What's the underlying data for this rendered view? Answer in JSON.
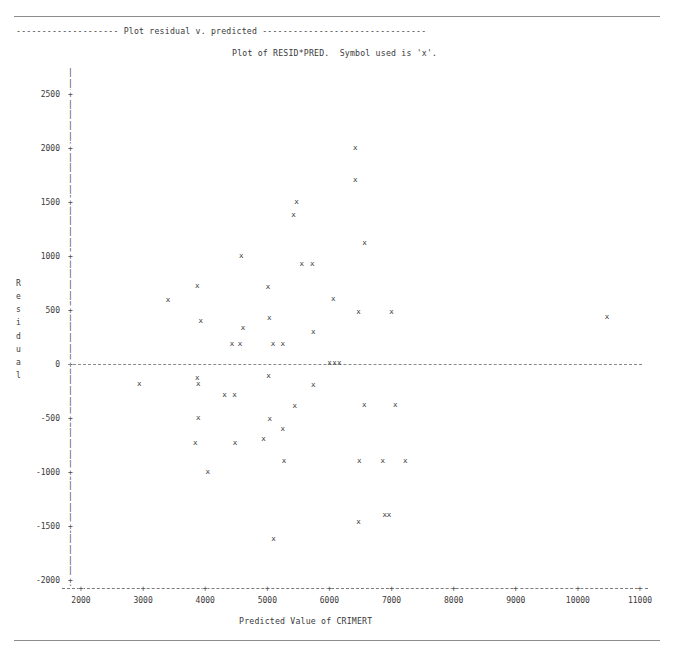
{
  "page": {
    "section_banner": "-------------------- Plot residual v. predicted --------------------------------",
    "plot_title": "Plot of RESID*PRED.  Symbol used is 'x'.",
    "rule_color": "#8d8d8d",
    "ink_color": "#2d2d2d"
  },
  "chart_data": {
    "type": "scatter",
    "title": "Plot of RESID*PRED.  Symbol used is 'x'.",
    "xlabel": "Predicted Value of CRIMERT",
    "ylabel": "Residual",
    "ylabel_letters": [
      "R",
      "e",
      "s",
      "i",
      "d",
      "u",
      "a",
      "l"
    ],
    "symbol": "x",
    "grid": false,
    "legend": "none",
    "xlim": [
      2000,
      11000
    ],
    "ylim": [
      -2000,
      2700
    ],
    "xticks": [
      2000,
      3000,
      4000,
      5000,
      6000,
      7000,
      8000,
      9000,
      10000,
      11000
    ],
    "yticks": [
      2500,
      2000,
      1500,
      1000,
      500,
      0,
      -500,
      -1000,
      -1500,
      -2000
    ],
    "ytick_labels": [
      "2500",
      "2000",
      "1500",
      "1000",
      "500",
      "0",
      "-500",
      "-1000",
      "-1500",
      "-2000"
    ],
    "xtick_labels": [
      "2000",
      "3000",
      "4000",
      "5000",
      "6000",
      "7000",
      "8000",
      "9000",
      "10000",
      "11000"
    ],
    "zero_line": 0,
    "points": [
      {
        "x": 6415,
        "y": 2000
      },
      {
        "x": 6415,
        "y": 1700
      },
      {
        "x": 5470,
        "y": 1500
      },
      {
        "x": 5420,
        "y": 1380
      },
      {
        "x": 6565,
        "y": 1120
      },
      {
        "x": 4580,
        "y": 1000
      },
      {
        "x": 5555,
        "y": 920
      },
      {
        "x": 5725,
        "y": 920
      },
      {
        "x": 3870,
        "y": 720
      },
      {
        "x": 5010,
        "y": 710
      },
      {
        "x": 6060,
        "y": 600
      },
      {
        "x": 3400,
        "y": 590
      },
      {
        "x": 6470,
        "y": 480
      },
      {
        "x": 7000,
        "y": 480
      },
      {
        "x": 10470,
        "y": 430
      },
      {
        "x": 3930,
        "y": 400
      },
      {
        "x": 5030,
        "y": 420
      },
      {
        "x": 4610,
        "y": 330
      },
      {
        "x": 5740,
        "y": 290
      },
      {
        "x": 4430,
        "y": 180
      },
      {
        "x": 4560,
        "y": 180
      },
      {
        "x": 5090,
        "y": 180
      },
      {
        "x": 5250,
        "y": 180
      },
      {
        "x": 6000,
        "y": 10
      },
      {
        "x": 6080,
        "y": 10
      },
      {
        "x": 6160,
        "y": 10
      },
      {
        "x": 5020,
        "y": -110
      },
      {
        "x": 3870,
        "y": -130
      },
      {
        "x": 2940,
        "y": -190
      },
      {
        "x": 3890,
        "y": -190
      },
      {
        "x": 5740,
        "y": -200
      },
      {
        "x": 4310,
        "y": -290
      },
      {
        "x": 4470,
        "y": -290
      },
      {
        "x": 5440,
        "y": -390
      },
      {
        "x": 6560,
        "y": -380
      },
      {
        "x": 7060,
        "y": -380
      },
      {
        "x": 3890,
        "y": -500
      },
      {
        "x": 5040,
        "y": -510
      },
      {
        "x": 5250,
        "y": -600
      },
      {
        "x": 3840,
        "y": -730
      },
      {
        "x": 4480,
        "y": -730
      },
      {
        "x": 4940,
        "y": -700
      },
      {
        "x": 5270,
        "y": -900
      },
      {
        "x": 6480,
        "y": -900
      },
      {
        "x": 6860,
        "y": -900
      },
      {
        "x": 7220,
        "y": -900
      },
      {
        "x": 4040,
        "y": -1000
      },
      {
        "x": 6470,
        "y": -1460
      },
      {
        "x": 6890,
        "y": -1400
      },
      {
        "x": 6960,
        "y": -1400
      },
      {
        "x": 5100,
        "y": -1620
      }
    ]
  }
}
